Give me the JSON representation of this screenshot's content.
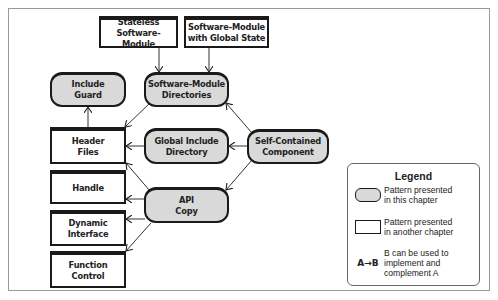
{
  "diagram": {
    "nodes": {
      "stateless": {
        "lines": [
          "Stateless",
          "Software-Module"
        ],
        "kind": "other-chapter"
      },
      "global_state": {
        "lines": [
          "Software-Module",
          "with Global State"
        ],
        "kind": "other-chapter"
      },
      "include_guard": {
        "lines": [
          "Include",
          "Guard"
        ],
        "kind": "this-chapter"
      },
      "sm_directories": {
        "lines": [
          "Software-Module",
          "Directories"
        ],
        "kind": "this-chapter"
      },
      "header_files": {
        "lines": [
          "Header",
          "Files"
        ],
        "kind": "other-chapter"
      },
      "global_include": {
        "lines": [
          "Global Include",
          "Directory"
        ],
        "kind": "this-chapter"
      },
      "self_contained": {
        "lines": [
          "Self-Contained",
          "Component"
        ],
        "kind": "this-chapter"
      },
      "handle": {
        "lines": [
          "Handle"
        ],
        "kind": "other-chapter"
      },
      "api_copy": {
        "lines": [
          "API",
          "Copy"
        ],
        "kind": "this-chapter"
      },
      "dynamic_interface": {
        "lines": [
          "Dynamic",
          "Interface"
        ],
        "kind": "other-chapter"
      },
      "function_control": {
        "lines": [
          "Function",
          "Control"
        ],
        "kind": "other-chapter"
      }
    },
    "edges": [
      {
        "from": "Stateless Software-Module",
        "to": "Software-Module Directories"
      },
      {
        "from": "Software-Module with Global State",
        "to": "Software-Module Directories"
      },
      {
        "from": "Header Files",
        "to": "Include Guard"
      },
      {
        "from": "Software-Module Directories",
        "to": "Header Files"
      },
      {
        "from": "Global Include Directory",
        "to": "Header Files"
      },
      {
        "from": "Self-Contained Component",
        "to": "Software-Module Directories"
      },
      {
        "from": "Self-Contained Component",
        "to": "Global Include Directory"
      },
      {
        "from": "Self-Contained Component",
        "to": "API Copy"
      },
      {
        "from": "API Copy",
        "to": "Header Files"
      },
      {
        "from": "API Copy",
        "to": "Handle"
      },
      {
        "from": "API Copy",
        "to": "Dynamic Interface"
      },
      {
        "from": "API Copy",
        "to": "Function Control"
      }
    ]
  },
  "legend": {
    "title": "Legend",
    "items": [
      {
        "symbol": "rounded-gray-box",
        "lines": [
          "Pattern presented",
          "in this chapter"
        ]
      },
      {
        "symbol": "white-rectangle",
        "lines": [
          "Pattern presented",
          "in another chapter"
        ]
      },
      {
        "symbol": "A→B",
        "lines": [
          "B can be used to",
          "implement and",
          "complement A"
        ]
      }
    ]
  },
  "colors": {
    "pattern_fill": "#d9d9d9",
    "stroke": "#1a1a1a",
    "frame": "#9a9a9a"
  }
}
